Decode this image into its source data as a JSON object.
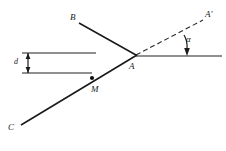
{
  "figure": {
    "type": "geometry-diagram",
    "background_color": "#ffffff",
    "stroke_color": "#1a1a1a",
    "reference_line_color": "#6a6a6a",
    "width": 226,
    "height": 151
  },
  "labels": {
    "vertex_a": "A",
    "point_b": "B",
    "point_c": "C",
    "point_m": "M",
    "point_a_prime": "A'",
    "angle_alpha": "α",
    "dimension": "d"
  },
  "caption": {
    "text": ""
  },
  "geometry": {
    "vertex_A": {
      "x": 136,
      "y": 55
    },
    "point_B": {
      "x": 78,
      "y": 22
    },
    "point_C": {
      "x": 20,
      "y": 126
    },
    "point_M": {
      "x": 92,
      "y": 78
    },
    "point_A_prime": {
      "x": 206,
      "y": 18
    },
    "horizontal_ray_end": {
      "x": 222,
      "y": 56
    },
    "upper_left_line": {
      "x1": 22,
      "y1": 53,
      "x2": 96,
      "y2": 53
    },
    "lower_left_line": {
      "x1": 22,
      "y1": 73,
      "x2": 92,
      "y2": 73
    },
    "dimension_bar": {
      "x": 28,
      "y1": 53,
      "y2": 73
    },
    "angle_marker": {
      "apex_x": 187,
      "apex_y": 56,
      "arc_radius": 22
    },
    "angle_alpha_degrees": 17,
    "dash_pattern": "5 3"
  },
  "elements": {
    "ray_ab_style": "solid",
    "ray_ac_style": "solid",
    "ray_a_aprime_style": "dashed",
    "horizontal_ray_style": "solid-gray",
    "point_m_marker": "filled-dot"
  }
}
